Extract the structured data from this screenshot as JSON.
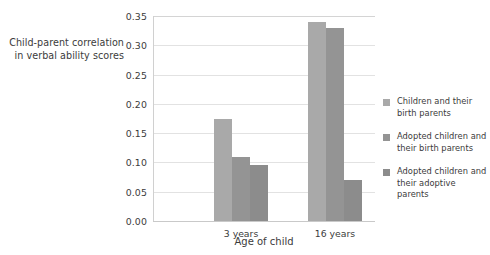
{
  "chart_data": {
    "type": "bar",
    "title": "",
    "xlabel": "Age of child",
    "ylabel": "Child-parent correlation in verbal ability scores",
    "categories": [
      "3 years",
      "16 years"
    ],
    "series": [
      {
        "name": "Children and their birth parents",
        "color": "#a9a9a9",
        "values": [
          0.175,
          0.34
        ]
      },
      {
        "name": "Adopted children and their birth parents",
        "color": "#949494",
        "values": [
          0.11,
          0.33
        ]
      },
      {
        "name": "Adopted children and their adoptive parents",
        "color": "#8c8c8c",
        "values": [
          0.095,
          0.07
        ]
      }
    ],
    "ylim": [
      0.0,
      0.35
    ],
    "yticks": [
      "0.00",
      "0.05",
      "0.10",
      "0.15",
      "0.20",
      "0.25",
      "0.30",
      "0.35"
    ],
    "ytick_values": [
      0.0,
      0.05,
      0.1,
      0.15,
      0.2,
      0.25,
      0.3,
      0.35
    ],
    "grid": true,
    "legend_position": "right"
  },
  "y_axis_title": {
    "line1": "Child-parent correlation",
    "line2": "in verbal ability scores"
  },
  "x_axis_title": "Age of child",
  "legend": {
    "items": [
      {
        "label_line1": "Children and their",
        "label_line2": "birth parents"
      },
      {
        "label_line1": "Adopted children and",
        "label_line2": "their birth parents"
      },
      {
        "label_line1": "Adopted children and",
        "label_line2": "their adoptive parents"
      }
    ]
  },
  "colors": {
    "series1": "#a9a9a9",
    "series2": "#949494",
    "series3": "#8c8c8c",
    "grid": "#e2e2e2",
    "axis": "#d0d0d0",
    "text": "#3b3b3b"
  }
}
